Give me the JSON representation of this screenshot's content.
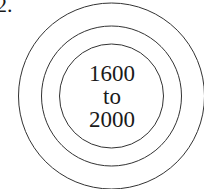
{
  "item_number": "2.",
  "diagram": {
    "type": "concentric-circles",
    "rings": 3,
    "center_label": {
      "line1": "1600",
      "line2": "to",
      "line3": "2000"
    },
    "stroke_color": "#333333"
  }
}
